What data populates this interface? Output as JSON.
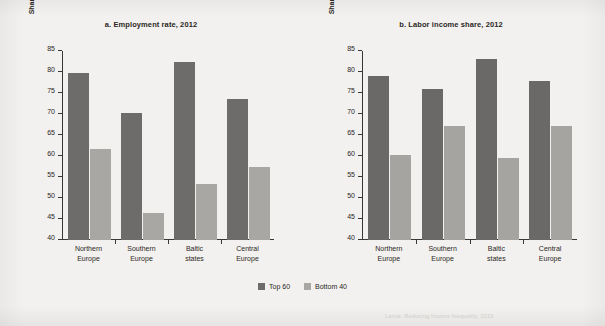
{
  "figure": {
    "legend": [
      {
        "label": "Top 60",
        "color": "#6e6c6a"
      },
      {
        "label": "Bottom 40",
        "color": "#a9a7a4"
      }
    ],
    "footnote_fragment": "Latvia: Reducing Income Inequality, 2015"
  },
  "chart_data": [
    {
      "type": "bar",
      "title": "a. Employment rate, 2012",
      "xlabel": "",
      "ylabel": "Share of people ages 25–64 (%)",
      "ylim": [
        40,
        85
      ],
      "yticks": [
        40,
        45,
        50,
        55,
        60,
        65,
        70,
        75,
        80,
        85
      ],
      "ytick_labels": [
        "40",
        "45",
        "50",
        "55",
        "60",
        "65",
        "70",
        "75",
        "80",
        "85"
      ],
      "grid": false,
      "legend_position": "bottom-center-shared",
      "categories": [
        "Northern Europe",
        "Southern Europe",
        "Baltic states",
        "Central Europe"
      ],
      "category_lines": [
        [
          "Northern",
          "Europe"
        ],
        [
          "Southern",
          "Europe"
        ],
        [
          "Baltic",
          "states"
        ],
        [
          "Central",
          "Europe"
        ]
      ],
      "series": [
        {
          "name": "Top 60",
          "color": "#6e6c6a",
          "values": [
            79.7,
            70.3,
            82.3,
            73.5
          ]
        },
        {
          "name": "Bottom 40",
          "color": "#a9a7a4",
          "values": [
            61.6,
            46.5,
            53.3,
            57.3
          ]
        }
      ]
    },
    {
      "type": "bar",
      "title": "b. Labor income share, 2012",
      "xlabel": "",
      "ylabel": "Share of people ages 25–64 (%)",
      "ylim": [
        40,
        85
      ],
      "yticks": [
        40,
        45,
        50,
        55,
        60,
        65,
        70,
        75,
        80,
        85
      ],
      "ytick_labels": [
        "40",
        "45",
        "50",
        "55",
        "60",
        "65",
        "70",
        "75",
        "80",
        "85"
      ],
      "grid": false,
      "legend_position": "bottom-center-shared",
      "categories": [
        "Northern Europe",
        "Southern Europe",
        "Baltic states",
        "Central Europe"
      ],
      "category_lines": [
        [
          "Northern",
          "Europe"
        ],
        [
          "Southern",
          "Europe"
        ],
        [
          "Baltic",
          "states"
        ],
        [
          "Central",
          "Europe"
        ]
      ],
      "series": [
        {
          "name": "Top 60",
          "color": "#6b6967",
          "values": [
            79.0,
            76.0,
            83.2,
            77.9
          ]
        },
        {
          "name": "Bottom 40",
          "color": "#a6a4a1",
          "values": [
            60.2,
            67.2,
            59.5,
            67.2
          ]
        }
      ]
    }
  ]
}
